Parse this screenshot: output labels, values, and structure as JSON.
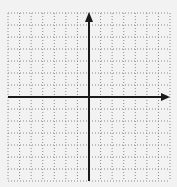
{
  "diagram": {
    "type": "coordinate-plane",
    "grid": {
      "columns": 14,
      "rows": 14,
      "style": "dotted",
      "color": "#8a8a8a"
    },
    "axes": {
      "x_axis": {
        "arrow": "right"
      },
      "y_axis": {
        "arrow": "up"
      },
      "color": "#1a1a1a"
    },
    "background": "#f2f2f2"
  }
}
